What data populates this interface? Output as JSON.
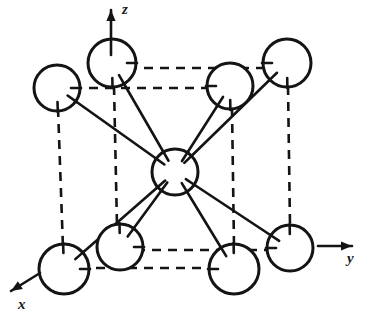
{
  "figure": {
    "type": "crystal-lattice-diagram",
    "background_color": "#ffffff",
    "stroke_color": "#141414"
  },
  "axes": [
    {
      "id": "z",
      "label": "z",
      "direction": "up",
      "label_x": 122,
      "label_y": 14,
      "line": {
        "x1": 111,
        "y1": 55,
        "x2": 111,
        "y2": 10
      }
    },
    {
      "id": "y",
      "label": "y",
      "direction": "right",
      "label_x": 347,
      "label_y": 263,
      "line": {
        "x1": 318,
        "y1": 246,
        "x2": 352,
        "y2": 246
      }
    },
    {
      "id": "x",
      "label": "x",
      "direction": "lower-left",
      "label_x": 18,
      "label_y": 309,
      "line": {
        "x1": 40,
        "y1": 273,
        "x2": 11,
        "y2": 291
      }
    }
  ],
  "atoms": [
    {
      "name": "corner-top-back-left",
      "cx": 112,
      "cy": 63,
      "r": 24
    },
    {
      "name": "corner-top-back-right",
      "cx": 287,
      "cy": 63,
      "r": 24
    },
    {
      "name": "corner-top-front-left",
      "cx": 57,
      "cy": 88,
      "r": 23
    },
    {
      "name": "corner-top-front-right",
      "cx": 230,
      "cy": 86,
      "r": 23
    },
    {
      "name": "corner-bottom-back-left",
      "cx": 120,
      "cy": 247,
      "r": 23
    },
    {
      "name": "corner-bottom-back-right",
      "cx": 290,
      "cy": 248,
      "r": 23
    },
    {
      "name": "corner-bottom-front-left",
      "cx": 64,
      "cy": 269,
      "r": 25
    },
    {
      "name": "corner-bottom-front-right",
      "cx": 234,
      "cy": 269,
      "r": 25
    },
    {
      "name": "body-center",
      "cx": 175,
      "cy": 172,
      "r": 23
    }
  ],
  "cube_edges": [
    {
      "name": "edge-top-back",
      "x1": 112,
      "y1": 68,
      "x2": 287,
      "y2": 68
    },
    {
      "name": "edge-top-front",
      "x1": 57,
      "y1": 88,
      "x2": 230,
      "y2": 88
    },
    {
      "name": "edge-bottom-back",
      "x1": 120,
      "y1": 250,
      "x2": 290,
      "y2": 250
    },
    {
      "name": "edge-bottom-front",
      "x1": 64,
      "y1": 268,
      "x2": 234,
      "y2": 268
    },
    {
      "name": "edge-vertical-front-left",
      "x1": 58,
      "y1": 108,
      "x2": 63,
      "y2": 248
    },
    {
      "name": "edge-vertical-back-left",
      "x1": 114,
      "y1": 86,
      "x2": 117,
      "y2": 226
    },
    {
      "name": "edge-vertical-front-right",
      "x1": 232,
      "y1": 108,
      "x2": 234,
      "y2": 246
    },
    {
      "name": "edge-vertical-back-right",
      "x1": 288,
      "y1": 86,
      "x2": 290,
      "y2": 226
    }
  ],
  "bonds": [
    {
      "name": "bond-center-to-top-back-left",
      "x1": 175,
      "y1": 172,
      "x2": 112,
      "y2": 63
    },
    {
      "name": "bond-center-to-top-back-right",
      "x1": 175,
      "y1": 172,
      "x2": 287,
      "y2": 63
    },
    {
      "name": "bond-center-to-top-front-left",
      "x1": 175,
      "y1": 172,
      "x2": 57,
      "y2": 88
    },
    {
      "name": "bond-center-to-top-front-right",
      "x1": 175,
      "y1": 172,
      "x2": 230,
      "y2": 86
    },
    {
      "name": "bond-center-to-bottom-back-left",
      "x1": 175,
      "y1": 172,
      "x2": 120,
      "y2": 247
    },
    {
      "name": "bond-center-to-bottom-back-right",
      "x1": 175,
      "y1": 172,
      "x2": 290,
      "y2": 248
    },
    {
      "name": "bond-center-to-bottom-front-left",
      "x1": 175,
      "y1": 172,
      "x2": 64,
      "y2": 269
    },
    {
      "name": "bond-center-to-bottom-front-right",
      "x1": 175,
      "y1": 172,
      "x2": 234,
      "y2": 269
    }
  ]
}
